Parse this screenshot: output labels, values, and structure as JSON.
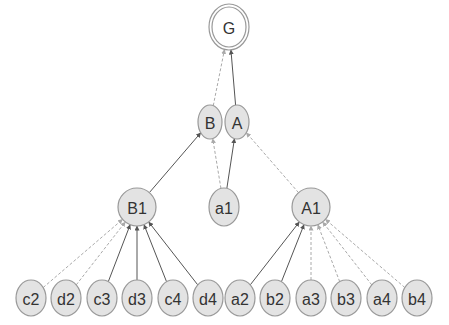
{
  "diagram": {
    "type": "tree",
    "nodes": [
      {
        "id": "G",
        "label": "G",
        "x": 229,
        "y": 27,
        "rx": 17,
        "ry": 20,
        "double": true
      },
      {
        "id": "B",
        "label": "B",
        "x": 210,
        "y": 122,
        "rx": 12,
        "ry": 17
      },
      {
        "id": "A",
        "label": "A",
        "x": 237,
        "y": 122,
        "rx": 12,
        "ry": 17
      },
      {
        "id": "B1",
        "label": "B1",
        "x": 137,
        "y": 207,
        "rx": 19,
        "ry": 19
      },
      {
        "id": "a1",
        "label": "a1",
        "x": 224,
        "y": 207,
        "rx": 15,
        "ry": 19
      },
      {
        "id": "A1",
        "label": "A1",
        "x": 311,
        "y": 207,
        "rx": 19,
        "ry": 19
      },
      {
        "id": "c2",
        "label": "c2",
        "x": 31,
        "y": 298,
        "rx": 15,
        "ry": 18
      },
      {
        "id": "d2",
        "label": "d2",
        "x": 66,
        "y": 298,
        "rx": 15,
        "ry": 18
      },
      {
        "id": "c3",
        "label": "c3",
        "x": 102,
        "y": 298,
        "rx": 15,
        "ry": 18
      },
      {
        "id": "d3",
        "label": "d3",
        "x": 137,
        "y": 298,
        "rx": 15,
        "ry": 18
      },
      {
        "id": "c4",
        "label": "c4",
        "x": 173,
        "y": 298,
        "rx": 15,
        "ry": 18
      },
      {
        "id": "d4",
        "label": "d4",
        "x": 208,
        "y": 298,
        "rx": 15,
        "ry": 18
      },
      {
        "id": "a2",
        "label": "a2",
        "x": 240,
        "y": 298,
        "rx": 15,
        "ry": 18
      },
      {
        "id": "b2",
        "label": "b2",
        "x": 275,
        "y": 298,
        "rx": 15,
        "ry": 18
      },
      {
        "id": "a3",
        "label": "a3",
        "x": 311,
        "y": 298,
        "rx": 15,
        "ry": 18
      },
      {
        "id": "b3",
        "label": "b3",
        "x": 346,
        "y": 298,
        "rx": 15,
        "ry": 18
      },
      {
        "id": "a4",
        "label": "a4",
        "x": 382,
        "y": 298,
        "rx": 15,
        "ry": 18
      },
      {
        "id": "b4",
        "label": "b4",
        "x": 417,
        "y": 298,
        "rx": 15,
        "ry": 18
      }
    ],
    "edges": [
      {
        "from": "B",
        "to": "G",
        "style": "dashed"
      },
      {
        "from": "A",
        "to": "G",
        "style": "solid"
      },
      {
        "from": "B1",
        "to": "B",
        "style": "solid"
      },
      {
        "from": "a1",
        "to": "B",
        "style": "dashed"
      },
      {
        "from": "a1",
        "to": "A",
        "style": "solid"
      },
      {
        "from": "A1",
        "to": "A",
        "style": "dashed"
      },
      {
        "from": "c2",
        "to": "B1",
        "style": "dashed"
      },
      {
        "from": "d2",
        "to": "B1",
        "style": "dashed"
      },
      {
        "from": "c3",
        "to": "B1",
        "style": "solid"
      },
      {
        "from": "d3",
        "to": "B1",
        "style": "solid"
      },
      {
        "from": "c4",
        "to": "B1",
        "style": "solid"
      },
      {
        "from": "d4",
        "to": "B1",
        "style": "solid"
      },
      {
        "from": "a2",
        "to": "A1",
        "style": "solid"
      },
      {
        "from": "b2",
        "to": "A1",
        "style": "solid"
      },
      {
        "from": "a3",
        "to": "A1",
        "style": "dashed"
      },
      {
        "from": "b3",
        "to": "A1",
        "style": "dashed"
      },
      {
        "from": "a4",
        "to": "A1",
        "style": "dashed"
      },
      {
        "from": "b4",
        "to": "A1",
        "style": "dashed"
      }
    ],
    "colors": {
      "node_fill": "#e3e3e3",
      "node_stroke": "#999999",
      "solid_edge": "#555555",
      "dashed_edge": "#aaaaaa",
      "text": "#333333"
    }
  }
}
